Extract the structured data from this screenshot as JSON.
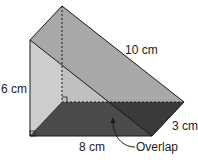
{
  "diagram": {
    "type": "triangular-prism",
    "labels": {
      "height": "6 cm",
      "hypotenuse": "10 cm",
      "base": "8 cm",
      "depth": "3 cm",
      "overlap": "Overlap"
    },
    "colors": {
      "left_face": "#cfcfcf",
      "slanted_face": "#a9a9a9",
      "base_face": "#4a4a4a",
      "edge": "#1a1a1a"
    }
  }
}
